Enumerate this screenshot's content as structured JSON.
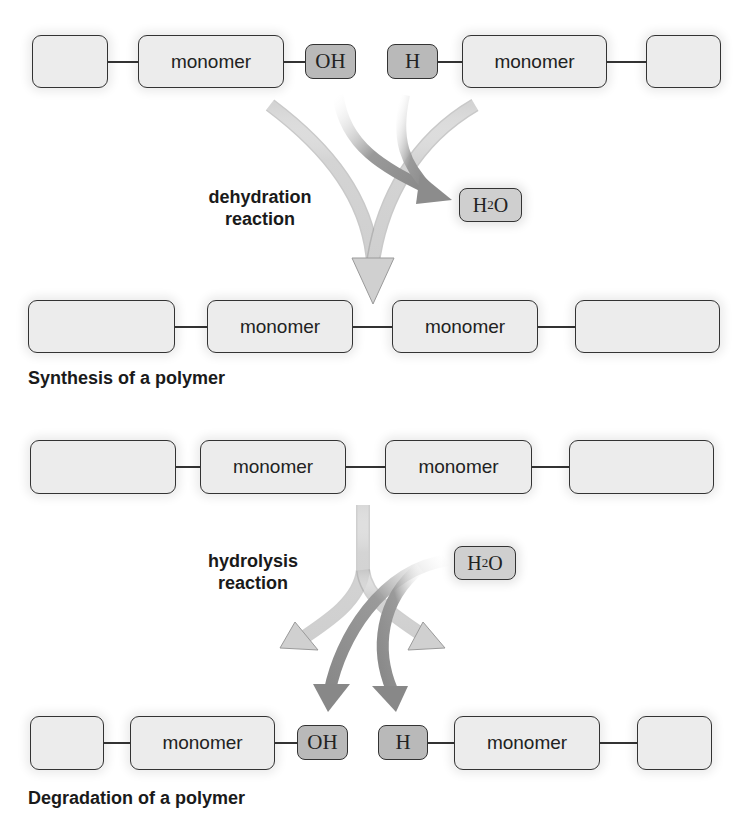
{
  "synthesis": {
    "reactants": {
      "left_chain": [
        "",
        "monomer"
      ],
      "left_end_group": "OH",
      "right_end_group": "H",
      "right_chain": [
        "monomer",
        ""
      ]
    },
    "reaction_label_line1": "dehydration",
    "reaction_label_line2": "reaction",
    "byproduct": {
      "main": "H",
      "sub": "2",
      "tail": "O"
    },
    "product_chain": [
      "",
      "monomer",
      "monomer",
      ""
    ],
    "caption": "Synthesis of a polymer"
  },
  "degradation": {
    "reactant_chain": [
      "",
      "monomer",
      "monomer",
      ""
    ],
    "reaction_label_line1": "hydrolysis",
    "reaction_label_line2": "reaction",
    "reagent": {
      "main": "H",
      "sub": "2",
      "tail": "O"
    },
    "products": {
      "left_chain": [
        "",
        "monomer"
      ],
      "left_end_group": "OH",
      "right_end_group": "H",
      "right_chain": [
        "monomer",
        ""
      ]
    },
    "caption": "Degradation of a polymer"
  },
  "colors": {
    "light_arrow": "#d6d6d6",
    "dark_arrow": "#8f8f8f",
    "monomer_fill": "#ececec",
    "end_group_fill": "#b9b9b9",
    "stroke": "#333333"
  }
}
